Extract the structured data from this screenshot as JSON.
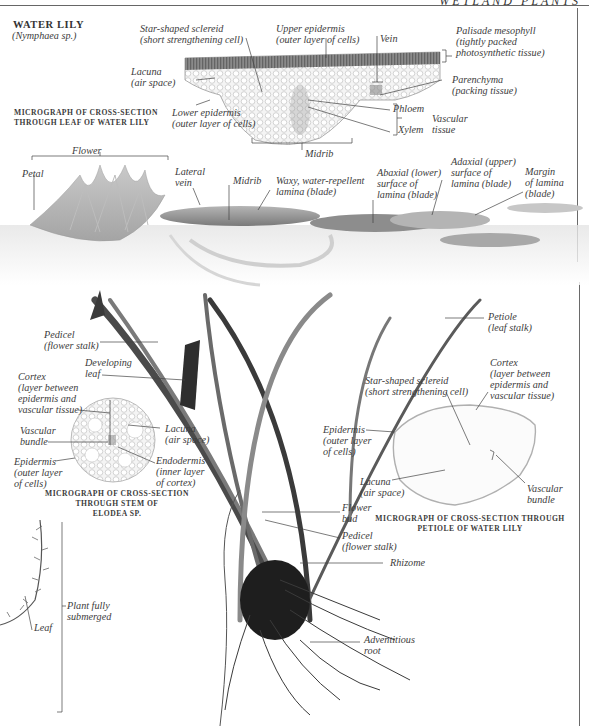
{
  "header": {
    "running_title": "WETLAND PLANTS"
  },
  "section": {
    "title": "WATER LILY",
    "subtitle": "(Nymphaea sp.)"
  },
  "leaf_micrograph": {
    "caption": "MICROGRAPH OF CROSS-SECTION\nTHROUGH LEAF OF WATER LILY",
    "labels": {
      "sclereid": "Star-shaped sclereid\n(short strengthening cell)",
      "upper_epidermis": "Upper epidermis\n(outer layer of cells)",
      "vein": "Vein",
      "palisade": "Palisade mesophyll\n(tightly packed\nphotosynthetic tissue)",
      "lacuna": "Lacuna\n(air space)",
      "parenchyma": "Parenchyma\n(packing tissue)",
      "lower_epidermis": "Lower epidermis\n(outer layer of cells)",
      "phloem": "Phloem",
      "xylem": "Xylem",
      "vascular_tissue": "Vascular\ntissue",
      "midrib": "Midrib"
    }
  },
  "surface_view": {
    "labels": {
      "flower": "Flower",
      "petal": "Petal",
      "lateral_vein": "Lateral\nvein",
      "midrib": "Midrib",
      "waxy": "Waxy, water-repellent\nlamina (blade)",
      "abaxial": "Abaxial (lower)\nsurface of\nlamina (blade)",
      "adaxial": "Adaxial (upper)\nsurface of\nlamina (blade)",
      "margin": "Margin\nof lamina\n(blade)"
    }
  },
  "underwater_view": {
    "labels": {
      "pedicel_top": "Pedicel\n(flower stalk)",
      "developing_leaf": "Developing\nleaf",
      "petiole": "Petiole\n(leaf stalk)",
      "flower_bud": "Flower\nbud",
      "pedicel_bottom": "Pedicel\n(flower stalk)",
      "rhizome": "Rhizome",
      "adventitious_root": "Adventitious\nroot"
    }
  },
  "elodea_micrograph": {
    "caption": "MICROGRAPH OF CROSS-SECTION\nTHROUGH STEM OF\nELODEA SP.",
    "labels": {
      "cortex": "Cortex\n(layer between\nepidermis and\nvascular tissue)",
      "vascular_bundle": "Vascular\nbundle",
      "lacuna": "Lacuna\n(air space)",
      "epidermis": "Epidermis\n(outer layer\nof cells)",
      "endodermis": "Endodermis\n(inner layer\nof cortex)"
    }
  },
  "elodea_plant": {
    "labels": {
      "leaf": "Leaf",
      "submerged": "Plant fully\nsubmerged"
    }
  },
  "petiole_micrograph": {
    "caption": "MICROGRAPH OF CROSS-SECTION THROUGH\nPETIOLE OF WATER LILY",
    "labels": {
      "sclereid": "Star-shaped sclereid\n(short strengthening cell)",
      "cortex": "Cortex\n(layer between\nepidermis and\nvascular tissue)",
      "epidermis": "Epidermis\n(outer layer\nof cells)",
      "lacuna": "Lacuna\n(air space)",
      "vascular_bundle": "Vascular\nbundle"
    }
  }
}
